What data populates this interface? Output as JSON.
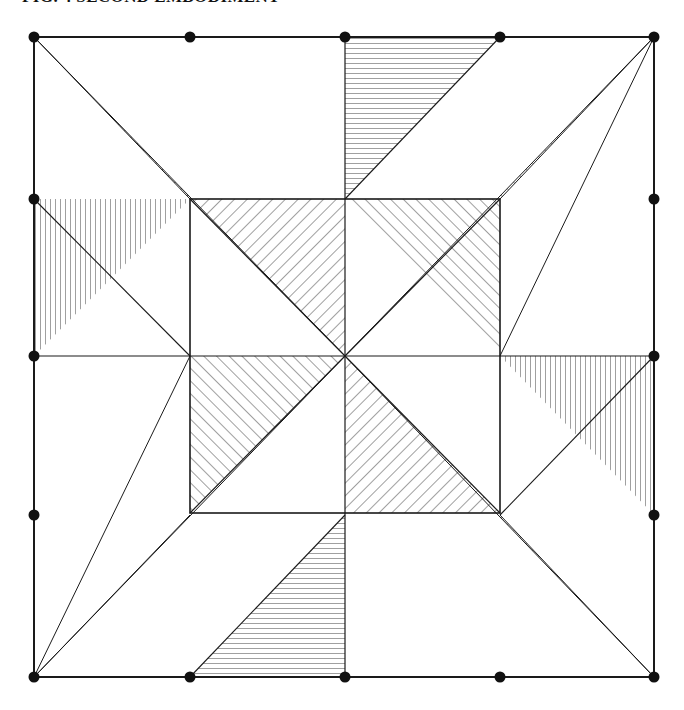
{
  "document": {
    "title": "FIG. 4 SECOND EMBODIMENT",
    "background_color": "#ffffff",
    "line_color": "#1a1a1a",
    "node_color": "#111111"
  },
  "figure": {
    "name": "symmetric-hatched-quilt-pattern",
    "outer_square": {
      "x1": 34,
      "y1": 24,
      "x2": 654,
      "y2": 664
    },
    "inner_square": {
      "x1": 190,
      "y1": 186,
      "x2": 500,
      "y2": 500
    },
    "center": {
      "x": 345,
      "y": 343
    },
    "node_radius": 5.5,
    "nodes": [
      {
        "id": "n-tl",
        "label": "top-left-corner",
        "x": 34,
        "y": 24
      },
      {
        "id": "n-t1",
        "label": "top-quarter",
        "x": 190,
        "y": 24
      },
      {
        "id": "n-t2",
        "label": "top-mid",
        "x": 345,
        "y": 24
      },
      {
        "id": "n-t3",
        "label": "top-three-quarter",
        "x": 500,
        "y": 24
      },
      {
        "id": "n-tr",
        "label": "top-right-corner",
        "x": 654,
        "y": 24
      },
      {
        "id": "n-l1",
        "label": "left-quarter",
        "x": 34,
        "y": 186
      },
      {
        "id": "n-l2",
        "label": "left-mid",
        "x": 34,
        "y": 343
      },
      {
        "id": "n-l3",
        "label": "left-three-quarter",
        "x": 34,
        "y": 502
      },
      {
        "id": "n-r1",
        "label": "right-quarter",
        "x": 654,
        "y": 186
      },
      {
        "id": "n-r2",
        "label": "right-mid",
        "x": 654,
        "y": 343
      },
      {
        "id": "n-r3",
        "label": "right-three-quarter",
        "x": 654,
        "y": 502
      },
      {
        "id": "n-bl",
        "label": "bottom-left-corner",
        "x": 34,
        "y": 664
      },
      {
        "id": "n-b1",
        "label": "bottom-quarter",
        "x": 190,
        "y": 664
      },
      {
        "id": "n-b2",
        "label": "bottom-mid",
        "x": 345,
        "y": 664
      },
      {
        "id": "n-b3",
        "label": "bottom-three-quarter",
        "x": 500,
        "y": 664
      },
      {
        "id": "n-br",
        "label": "bottom-right-corner",
        "x": 654,
        "y": 664
      }
    ],
    "hatch_patterns": {
      "diagonal_right": {
        "angle_deg": 45,
        "spacing": 9,
        "stroke_width": 0.9
      },
      "diagonal_left": {
        "angle_deg": -45,
        "spacing": 9,
        "stroke_width": 0.9
      },
      "vertical": {
        "angle_deg": 90,
        "spacing": 5,
        "stroke_width": 0.9
      },
      "horizontal": {
        "angle_deg": 0,
        "spacing": 5,
        "stroke_width": 0.9
      }
    },
    "regions": [
      {
        "id": "fan-tl",
        "label": "corner-fan-top-left",
        "hatch": "diagonal-right",
        "apex": "top-left-corner"
      },
      {
        "id": "fan-tr",
        "label": "corner-fan-top-right",
        "hatch": "diagonal-left",
        "apex": "top-right-corner"
      },
      {
        "id": "fan-bl",
        "label": "corner-fan-bottom-left",
        "hatch": "diagonal-left",
        "apex": "bottom-left-corner"
      },
      {
        "id": "fan-br",
        "label": "corner-fan-bottom-right",
        "hatch": "diagonal-right",
        "apex": "bottom-right-corner"
      },
      {
        "id": "edge-top",
        "label": "edge-triangle-top",
        "hatch": "horizontal"
      },
      {
        "id": "edge-left",
        "label": "edge-triangle-left",
        "hatch": "vertical"
      },
      {
        "id": "edge-right",
        "label": "edge-triangle-right",
        "hatch": "vertical"
      },
      {
        "id": "edge-bottom",
        "label": "edge-triangle-bottom",
        "hatch": "horizontal"
      },
      {
        "id": "pin-tl",
        "label": "pinwheel-quadrant-top-left",
        "hatch": "diagonal-right"
      },
      {
        "id": "pin-tr",
        "label": "pinwheel-quadrant-top-right",
        "hatch": "diagonal-left"
      },
      {
        "id": "pin-bl",
        "label": "pinwheel-quadrant-bottom-left",
        "hatch": "diagonal-left"
      },
      {
        "id": "pin-br",
        "label": "pinwheel-quadrant-bottom-right",
        "hatch": "diagonal-right"
      }
    ]
  }
}
